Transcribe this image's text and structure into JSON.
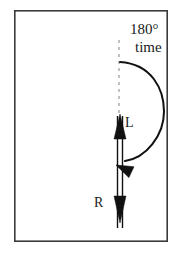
{
  "figure": {
    "frame": {
      "x": 14,
      "y": 10,
      "width": 154,
      "height": 232,
      "stroke_color": "#3a3a3a",
      "stroke_width": 1.6,
      "fill_color": "#ffffff"
    },
    "labels": {
      "angle": "180°",
      "time": "time",
      "left_vector": "L",
      "right_vector": "R"
    },
    "colors": {
      "ink": "#111111",
      "dashed_guide": "#9a9a9a",
      "frame": "#3a3a3a",
      "background": "#ffffff"
    },
    "dashed_guide": {
      "name": "vertical-reference-axis",
      "x": 119,
      "y_start": 40,
      "y_end": 118,
      "dash_pattern": "3 4",
      "stroke_width": 1.2
    },
    "rotation_arc": {
      "name": "semicircular-rotation-arc",
      "start_x": 120,
      "start_y": 62,
      "end_x": 121,
      "end_y": 161,
      "bulge_x": 164,
      "sweep_degrees": 180,
      "direction": "clockwise",
      "stroke_width": 2.0,
      "arrowhead": {
        "tip_x": 116,
        "tip_y": 165,
        "angle_degrees": 205,
        "length": 17,
        "half_width": 6
      }
    },
    "vector_shaft": {
      "name": "double-line-vector-shaft",
      "left_x": 117.5,
      "right_x": 122.5,
      "y_top": 116,
      "y_bottom": 228,
      "stroke_width": 1.4
    },
    "up_arrowhead": {
      "name": "upward-vector-head-L",
      "tip_x": 120,
      "tip_y": 114,
      "base_y": 139,
      "half_width": 6
    },
    "down_arrowhead": {
      "name": "downward-vector-head-R",
      "tip_x": 120,
      "tip_y": 223,
      "base_y": 196,
      "half_width": 6
    }
  },
  "chart_data": {
    "type": "diagram",
    "annotations": [
      "180°",
      "time",
      "L",
      "R"
    ],
    "elements": [
      {
        "name": "vertical-reference-axis",
        "kind": "dashed-line",
        "from": [
          119,
          40
        ],
        "to": [
          119,
          118
        ]
      },
      {
        "name": "semicircular-rotation-arc",
        "kind": "arc",
        "from": [
          120,
          62
        ],
        "to": [
          121,
          161
        ],
        "sweep_degrees": 180,
        "direction": "clockwise"
      },
      {
        "name": "upward-vector-L",
        "kind": "arrow",
        "from": [
          120,
          228
        ],
        "to": [
          120,
          114
        ],
        "label": "L"
      },
      {
        "name": "downward-vector-R",
        "kind": "arrow",
        "from": [
          120,
          116
        ],
        "to": [
          120,
          223
        ],
        "label": "R"
      }
    ]
  }
}
